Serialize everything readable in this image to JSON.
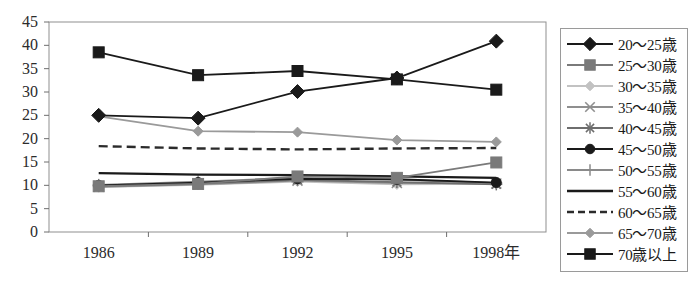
{
  "chart_data": {
    "type": "line",
    "title": "",
    "xlabel": "",
    "ylabel": "",
    "categories": [
      "1986",
      "1989",
      "1992",
      "1995",
      "1998年"
    ],
    "x_tick_labels": [
      "1986",
      "1989",
      "1992",
      "1995",
      "1998年"
    ],
    "y_tick_labels": [
      "0",
      "5",
      "10",
      "15",
      "20",
      "25",
      "30",
      "35",
      "40",
      "45"
    ],
    "ylim": [
      0,
      45
    ],
    "y_step": 5,
    "grid": false,
    "legend_position": "right-outside",
    "series": [
      {
        "name": "20～25歳",
        "marker": "diamond",
        "color": "#1a1a1a",
        "line_style": "solid",
        "values": [
          25.0,
          24.4,
          30.1,
          33.0,
          40.9
        ]
      },
      {
        "name": "25～30歳",
        "marker": "square",
        "color": "#7a7a7a",
        "line_style": "solid",
        "values": [
          9.8,
          10.3,
          11.9,
          11.6,
          14.9
        ]
      },
      {
        "name": "30～35歳",
        "marker": "small-diamond",
        "color": "#c2c2c2",
        "line_style": "solid",
        "values": [
          9.6,
          10.1,
          10.8,
          10.2,
          10.3
        ]
      },
      {
        "name": "35～40歳",
        "marker": "x",
        "color": "#8f8f8f",
        "line_style": "solid",
        "values": [
          9.7,
          10.2,
          11.0,
          10.5,
          10.4
        ]
      },
      {
        "name": "40～45歳",
        "marker": "asterisk",
        "color": "#6e6e6e",
        "line_style": "solid",
        "values": [
          9.9,
          10.4,
          11.2,
          10.7,
          10.2
        ]
      },
      {
        "name": "45～50歳",
        "marker": "circle",
        "color": "#1a1a1a",
        "line_style": "solid",
        "values": [
          10.0,
          10.6,
          11.4,
          11.3,
          10.6
        ]
      },
      {
        "name": "50～55歳",
        "marker": "plus",
        "color": "#8a8a8a",
        "line_style": "solid",
        "values": [
          10.1,
          10.8,
          11.6,
          11.2,
          10.5
        ]
      },
      {
        "name": "55～60歳",
        "marker": "none",
        "color": "#1a1a1a",
        "line_style": "solid",
        "values": [
          12.6,
          12.3,
          12.2,
          11.9,
          11.6
        ]
      },
      {
        "name": "60～65歳",
        "marker": "none",
        "color": "#2b2b2b",
        "line_style": "dashed",
        "values": [
          18.4,
          17.9,
          17.7,
          17.9,
          18.0
        ]
      },
      {
        "name": "65～70歳",
        "marker": "small-diamond",
        "color": "#9a9a9a",
        "line_style": "solid",
        "values": [
          24.8,
          21.6,
          21.4,
          19.7,
          19.3
        ]
      },
      {
        "name": "70歳以上",
        "marker": "square",
        "color": "#1a1a1a",
        "line_style": "solid",
        "values": [
          38.5,
          33.6,
          34.5,
          32.7,
          30.5
        ]
      }
    ]
  },
  "legend": {
    "entries": [
      "20～25歳",
      "25～30歳",
      "30～35歳",
      "35～40歳",
      "40～45歳",
      "45～50歳",
      "50～55歳",
      "55～60歳",
      "60～65歳",
      "65～70歳",
      "70歳以上"
    ]
  },
  "caption": {
    "text": ""
  }
}
